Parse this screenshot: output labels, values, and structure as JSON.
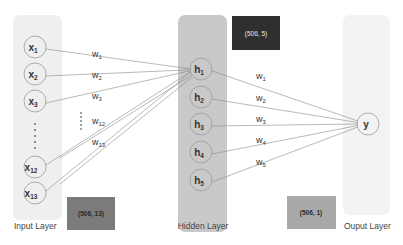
{
  "diagram": {
    "type": "neural-network",
    "layers": {
      "input": {
        "label": "Input Layer",
        "shape_label": "(506, 13)",
        "nodes": [
          {
            "name": "x",
            "sub": "1"
          },
          {
            "name": "x",
            "sub": "2"
          },
          {
            "name": "x",
            "sub": "3"
          },
          {
            "name": "x",
            "sub": "12"
          },
          {
            "name": "x",
            "sub": "13"
          }
        ],
        "ellipsis": true
      },
      "hidden": {
        "label": "Hidden Layer",
        "shape_label": "(506, 5)",
        "nodes": [
          {
            "name": "h",
            "sub": "1"
          },
          {
            "name": "h",
            "sub": "2"
          },
          {
            "name": "h",
            "sub": "3"
          },
          {
            "name": "h",
            "sub": "4"
          },
          {
            "name": "h",
            "sub": "5"
          }
        ]
      },
      "output": {
        "label": "Ouput Layer",
        "shape_label": "(506, 1)",
        "nodes": [
          {
            "name": "y",
            "sub": ""
          }
        ]
      }
    },
    "input_weights": [
      {
        "name": "w",
        "sub": "1"
      },
      {
        "name": "w",
        "sub": "2"
      },
      {
        "name": "w",
        "sub": "3"
      },
      {
        "name": "w",
        "sub": "12"
      },
      {
        "name": "w",
        "sub": "13"
      }
    ],
    "output_weights": [
      {
        "name": "w",
        "sub": "1"
      },
      {
        "name": "w",
        "sub": "2"
      },
      {
        "name": "w",
        "sub": "3"
      },
      {
        "name": "w",
        "sub": "4"
      },
      {
        "name": "w",
        "sub": "5"
      }
    ],
    "colors": {
      "input_panel": "#efefef",
      "hidden_panel": "#c9c9c9",
      "output_panel": "#f3f3f3",
      "input_shape_box": "#7b7b7b",
      "hidden_shape_box": "#2f2f2f",
      "output_shape_box": "#a9a9a9",
      "node_stroke": "#9a9a9a",
      "edge_stroke": "#8a8a8a",
      "text": "#333333"
    }
  }
}
